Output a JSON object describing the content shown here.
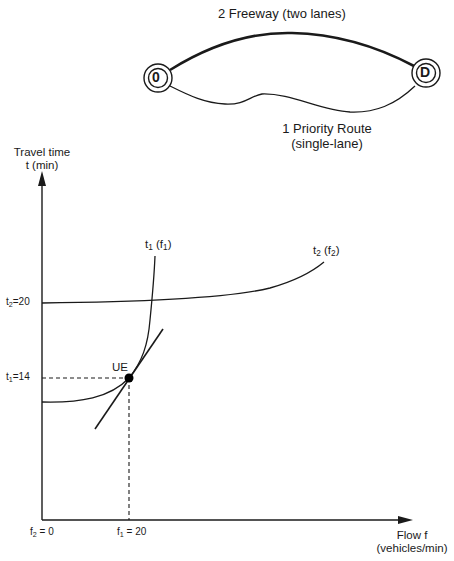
{
  "network": {
    "origin_node": "0",
    "destination_node": "D",
    "route_2_label": "2 Freeway (two lanes)",
    "route_1_label_line1": "1 Priority Route",
    "route_1_label_line2": "(single-lane)"
  },
  "graph": {
    "y_axis_label_line1": "Travel time",
    "y_axis_label_line2": "t (min)",
    "x_axis_label_line1": "Flow f",
    "x_axis_label_line2": "(vehicles/min)",
    "curve_1": {
      "name": "t",
      "sub": "1",
      "arg": "f",
      "argsub": "1"
    },
    "curve_2": {
      "name": "t",
      "sub": "2",
      "arg": "f",
      "argsub": "2"
    },
    "equilibrium_label": "UE",
    "y_ticks": [
      {
        "name": "t",
        "sub": "2",
        "value": "=20"
      },
      {
        "name": "t",
        "sub": "1",
        "value": "=14"
      }
    ],
    "x_ticks": [
      {
        "name": "f",
        "sub": "2",
        "value": " = 0"
      },
      {
        "name": "f",
        "sub": "1",
        "value": " = 20"
      }
    ]
  },
  "colors": {
    "line": "#1a1a1a",
    "background": "#ffffff"
  }
}
